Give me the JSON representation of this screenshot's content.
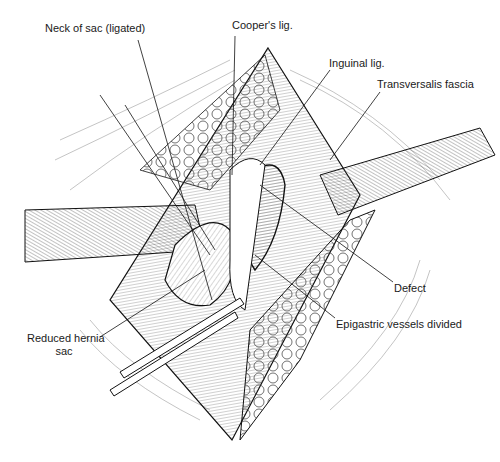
{
  "figure": {
    "type": "surgical illustration"
  },
  "labels": {
    "neck_of_sac": "Neck of sac (ligated)",
    "coopers_lig": "Cooper's lig.",
    "inguinal_lig": "Inguinal lig.",
    "transversalis_fascia": "Transversalis fascia",
    "defect": "Defect",
    "epigastric_vessels": "Epigastric vessels divided",
    "reduced_hernia_sac_line1": "Reduced hernia",
    "reduced_hernia_sac_line2": "sac"
  },
  "colors": {
    "ink": "#1a1a1a",
    "background": "#ffffff"
  }
}
